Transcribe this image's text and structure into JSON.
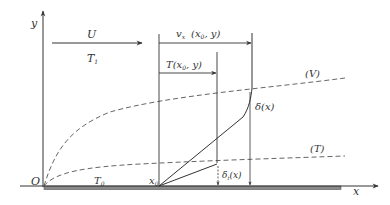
{
  "diagram": {
    "axis_labels": {
      "y": "y",
      "x": "x",
      "origin": "O"
    },
    "free_stream": {
      "velocity": "U",
      "temperature": "T",
      "temperature_sub": "1"
    },
    "wall_temperature": {
      "symbol": "T",
      "sub": "0"
    },
    "start_point": {
      "symbol": "x",
      "sub": "0"
    },
    "velocity_profile": {
      "prefix": "v",
      "sub": "x",
      "args": "(x",
      "args_sub": "0",
      "args_rest": ", y)"
    },
    "temperature_profile": {
      "prefix": "T(x",
      "sub": "0",
      "rest": ", y)"
    },
    "velocity_bl_thickness": "δ(x)",
    "thermal_bl_thickness": {
      "symbol": "δ",
      "sub": "t",
      "rest": "(x)"
    },
    "curve_labels": {
      "velocity": "(V)",
      "thermal": "(T)"
    },
    "colors": {
      "line": "#333333",
      "dashed": "#555555",
      "plate": "#888888"
    }
  }
}
